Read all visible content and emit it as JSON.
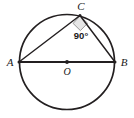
{
  "figure": {
    "type": "geometry-diagram",
    "background_color": "#ffffff",
    "stroke_color": "#231f20",
    "angle_fill_color": "#e6e6e6",
    "circle": {
      "center_label": "O",
      "center_x": 67,
      "center_y": 62,
      "radius": 48,
      "stroke_width": 1.6
    },
    "points": [
      {
        "label": "A",
        "x": 19,
        "y": 62,
        "label_x": 10,
        "label_y": 65
      },
      {
        "label": "B",
        "x": 115,
        "y": 62,
        "label_x": 120,
        "label_y": 65
      },
      {
        "label": "C",
        "x": 80,
        "y": 15,
        "label_x": 80,
        "label_y": 9
      },
      {
        "label": "O",
        "x": 67,
        "y": 62,
        "label_x": 67,
        "label_y": 74
      }
    ],
    "segments": [
      {
        "name": "diameter-ab",
        "from": "A",
        "to": "B",
        "stroke_width": 1.8
      },
      {
        "name": "chord-ac",
        "from": "A",
        "to": "C",
        "stroke_width": 1.4
      },
      {
        "name": "chord-cb",
        "from": "C",
        "to": "B",
        "stroke_width": 1.4
      }
    ],
    "angle_marker": {
      "at_point": "C",
      "value_label": "90°",
      "label_x": 81,
      "label_y": 38,
      "size": 9
    }
  }
}
